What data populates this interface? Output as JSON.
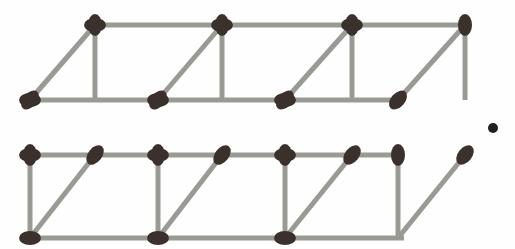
{
  "figure": {
    "object_count": 3,
    "shape_name": "cube",
    "arrangement": "row",
    "colors": {
      "background": "#fefefe",
      "stick": "#9a9a94",
      "stick_shade": "#8c8c86",
      "head": "#3b312c",
      "head_dark": "#2f2722",
      "stray_dot": "#231f1c"
    },
    "geometry": {
      "canvas_width": 515,
      "canvas_height": 249,
      "depth_offset_x": -65,
      "depth_offset_y": 75,
      "cell_width": 127,
      "cell_height": 138,
      "back_row_y_top": 25,
      "back_row_y_bottom": 100,
      "front_row_y_top": 155,
      "front_row_y_bottom": 238,
      "back_columns_x": [
        95,
        222,
        352,
        465
      ],
      "front_columns_x": [
        30,
        158,
        285,
        398
      ],
      "head_radius_x": 11,
      "head_radius_y": 7,
      "stick_width": 5
    },
    "stray_dot": {
      "label": "stray-dot",
      "cx": 493,
      "cy": 128,
      "r": 5
    },
    "matches": [
      {
        "id": "back-top-1",
        "role": "back-top-horizontal",
        "x1": 95,
        "y1": 25,
        "x2": 222,
        "y2": 25,
        "head_at": "start"
      },
      {
        "id": "back-top-2",
        "role": "back-top-horizontal",
        "x1": 222,
        "y1": 25,
        "x2": 352,
        "y2": 25,
        "head_at": "start"
      },
      {
        "id": "back-top-3",
        "role": "back-top-horizontal",
        "x1": 352,
        "y1": 25,
        "x2": 470,
        "y2": 25,
        "head_at": "start"
      },
      {
        "id": "back-bot-1",
        "role": "back-bottom-horizontal",
        "x1": 30,
        "y1": 100,
        "x2": 158,
        "y2": 100,
        "head_at": "start"
      },
      {
        "id": "back-bot-2",
        "role": "back-bottom-horizontal",
        "x1": 158,
        "y1": 100,
        "x2": 285,
        "y2": 100,
        "head_at": "start"
      },
      {
        "id": "back-bot-3",
        "role": "back-bottom-horizontal",
        "x1": 285,
        "y1": 100,
        "x2": 404,
        "y2": 100,
        "head_at": "start"
      },
      {
        "id": "back-vert-1",
        "role": "back-vertical",
        "x1": 95,
        "y1": 25,
        "x2": 95,
        "y2": 100,
        "head_at": "start"
      },
      {
        "id": "back-vert-2",
        "role": "back-vertical",
        "x1": 222,
        "y1": 25,
        "x2": 222,
        "y2": 100,
        "head_at": "start"
      },
      {
        "id": "back-vert-3",
        "role": "back-vertical",
        "x1": 352,
        "y1": 25,
        "x2": 352,
        "y2": 100,
        "head_at": "start"
      },
      {
        "id": "back-vert-4",
        "role": "back-vertical",
        "x1": 465,
        "y1": 25,
        "x2": 465,
        "y2": 100,
        "head_at": "start"
      },
      {
        "id": "front-top-1",
        "role": "front-top-horizontal",
        "x1": 30,
        "y1": 155,
        "x2": 158,
        "y2": 155,
        "head_at": "start"
      },
      {
        "id": "front-top-2",
        "role": "front-top-horizontal",
        "x1": 158,
        "y1": 155,
        "x2": 285,
        "y2": 155,
        "head_at": "start"
      },
      {
        "id": "front-top-3",
        "role": "front-top-horizontal",
        "x1": 285,
        "y1": 155,
        "x2": 404,
        "y2": 155,
        "head_at": "start"
      },
      {
        "id": "front-bot-1",
        "role": "front-bottom-horizontal",
        "x1": 30,
        "y1": 238,
        "x2": 158,
        "y2": 238,
        "head_at": "start"
      },
      {
        "id": "front-bot-2",
        "role": "front-bottom-horizontal",
        "x1": 158,
        "y1": 238,
        "x2": 285,
        "y2": 238,
        "head_at": "start"
      },
      {
        "id": "front-bot-3",
        "role": "front-bottom-horizontal",
        "x1": 285,
        "y1": 238,
        "x2": 404,
        "y2": 238,
        "head_at": "start"
      },
      {
        "id": "front-vert-1",
        "role": "front-vertical",
        "x1": 30,
        "y1": 155,
        "x2": 30,
        "y2": 240,
        "head_at": "start"
      },
      {
        "id": "front-vert-2",
        "role": "front-vertical",
        "x1": 158,
        "y1": 155,
        "x2": 158,
        "y2": 240,
        "head_at": "start"
      },
      {
        "id": "front-vert-3",
        "role": "front-vertical",
        "x1": 285,
        "y1": 155,
        "x2": 285,
        "y2": 240,
        "head_at": "start"
      },
      {
        "id": "front-vert-4",
        "role": "front-vertical",
        "x1": 398,
        "y1": 155,
        "x2": 398,
        "y2": 240,
        "head_at": "start"
      },
      {
        "id": "depth-top-1",
        "role": "depth-diagonal-top",
        "x1": 95,
        "y1": 25,
        "x2": 30,
        "y2": 100,
        "head_at": "end"
      },
      {
        "id": "depth-top-2",
        "role": "depth-diagonal-top",
        "x1": 222,
        "y1": 25,
        "x2": 158,
        "y2": 100,
        "head_at": "end"
      },
      {
        "id": "depth-top-3",
        "role": "depth-diagonal-top",
        "x1": 352,
        "y1": 25,
        "x2": 285,
        "y2": 100,
        "head_at": "end"
      },
      {
        "id": "depth-top-4",
        "role": "depth-diagonal-top",
        "x1": 465,
        "y1": 25,
        "x2": 398,
        "y2": 100,
        "head_at": "end"
      },
      {
        "id": "depth-bot-1",
        "role": "depth-diagonal-bottom",
        "x1": 95,
        "y1": 155,
        "x2": 30,
        "y2": 238,
        "head_at": "start"
      },
      {
        "id": "depth-bot-2",
        "role": "depth-diagonal-bottom",
        "x1": 222,
        "y1": 155,
        "x2": 158,
        "y2": 238,
        "head_at": "start"
      },
      {
        "id": "depth-bot-3",
        "role": "depth-diagonal-bottom",
        "x1": 352,
        "y1": 155,
        "x2": 285,
        "y2": 238,
        "head_at": "start"
      },
      {
        "id": "depth-bot-4",
        "role": "depth-diagonal-bottom",
        "x1": 465,
        "y1": 155,
        "x2": 398,
        "y2": 238,
        "head_at": "start"
      }
    ]
  }
}
